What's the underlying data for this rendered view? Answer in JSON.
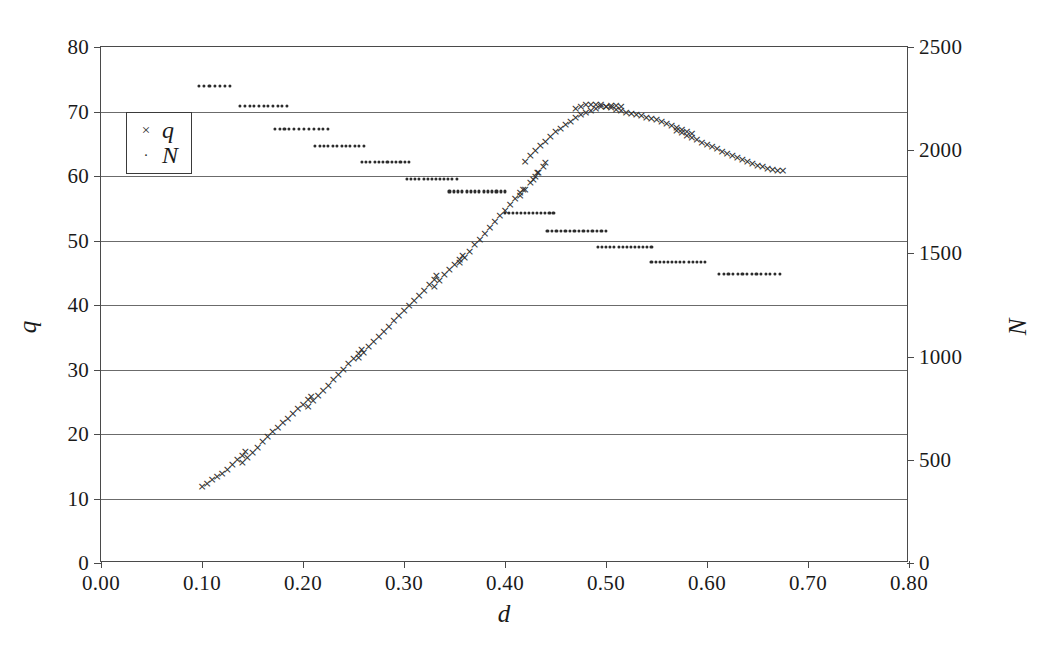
{
  "chart_data": {
    "type": "scatter",
    "title": "",
    "xlabel": "d",
    "ylabel": "q",
    "ylabel_right": "N",
    "xlim": [
      0.0,
      0.8
    ],
    "ylim": [
      0,
      80
    ],
    "ylim_right": [
      0,
      2500
    ],
    "grid": true,
    "legend_position": "upper-left-inside",
    "xticks": [
      "0.00",
      "0.10",
      "0.20",
      "0.30",
      "0.40",
      "0.50",
      "0.60",
      "0.70",
      "0.80"
    ],
    "xtick_values": [
      0.0,
      0.1,
      0.2,
      0.3,
      0.4,
      0.5,
      0.6,
      0.7,
      0.8
    ],
    "yticks": [
      "0",
      "10",
      "20",
      "30",
      "40",
      "50",
      "60",
      "70",
      "80"
    ],
    "ytick_values": [
      0,
      10,
      20,
      30,
      40,
      50,
      60,
      70,
      80
    ],
    "yticks_right": [
      "0",
      "500",
      "1000",
      "1500",
      "2000",
      "2500"
    ],
    "ytick_right_values": [
      0,
      500,
      1000,
      1500,
      2000,
      2500
    ],
    "series": [
      {
        "name": "q",
        "axis": "left",
        "marker": "x",
        "marker_glyph": "×",
        "color": "#2b2b2b",
        "points": [
          [
            0.1,
            12.0
          ],
          [
            0.105,
            12.4
          ],
          [
            0.11,
            13.0
          ],
          [
            0.115,
            13.5
          ],
          [
            0.12,
            14.0
          ],
          [
            0.125,
            14.6
          ],
          [
            0.13,
            15.3
          ],
          [
            0.135,
            16.1
          ],
          [
            0.14,
            16.8
          ],
          [
            0.143,
            17.3
          ],
          [
            0.14,
            15.6
          ],
          [
            0.145,
            16.4
          ],
          [
            0.15,
            17.2
          ],
          [
            0.155,
            18.0
          ],
          [
            0.16,
            18.9
          ],
          [
            0.165,
            19.7
          ],
          [
            0.17,
            20.4
          ],
          [
            0.175,
            21.1
          ],
          [
            0.18,
            21.8
          ],
          [
            0.185,
            22.5
          ],
          [
            0.19,
            23.3
          ],
          [
            0.195,
            24.0
          ],
          [
            0.2,
            24.7
          ],
          [
            0.205,
            25.4
          ],
          [
            0.208,
            25.9
          ],
          [
            0.205,
            24.3
          ],
          [
            0.21,
            25.2
          ],
          [
            0.215,
            26.0
          ],
          [
            0.22,
            26.8
          ],
          [
            0.225,
            27.6
          ],
          [
            0.23,
            28.5
          ],
          [
            0.235,
            29.3
          ],
          [
            0.24,
            30.1
          ],
          [
            0.245,
            31.0
          ],
          [
            0.25,
            31.8
          ],
          [
            0.255,
            32.6
          ],
          [
            0.258,
            33.2
          ],
          [
            0.255,
            31.9
          ],
          [
            0.26,
            32.7
          ],
          [
            0.265,
            33.6
          ],
          [
            0.27,
            34.4
          ],
          [
            0.275,
            35.2
          ],
          [
            0.28,
            36.0
          ],
          [
            0.285,
            36.8
          ],
          [
            0.29,
            37.6
          ],
          [
            0.295,
            38.4
          ],
          [
            0.3,
            39.2
          ],
          [
            0.305,
            40.0
          ],
          [
            0.31,
            40.8
          ],
          [
            0.315,
            41.6
          ],
          [
            0.32,
            42.4
          ],
          [
            0.325,
            43.2
          ],
          [
            0.33,
            44.0
          ],
          [
            0.332,
            44.6
          ],
          [
            0.33,
            43.0
          ],
          [
            0.335,
            43.9
          ],
          [
            0.34,
            44.8
          ],
          [
            0.345,
            45.6
          ],
          [
            0.35,
            46.4
          ],
          [
            0.355,
            47.2
          ],
          [
            0.358,
            47.8
          ],
          [
            0.355,
            46.6
          ],
          [
            0.36,
            47.5
          ],
          [
            0.365,
            48.4
          ],
          [
            0.37,
            49.4
          ],
          [
            0.375,
            50.3
          ],
          [
            0.38,
            51.2
          ],
          [
            0.385,
            52.1
          ],
          [
            0.39,
            53.0
          ],
          [
            0.395,
            53.9
          ],
          [
            0.4,
            54.8
          ],
          [
            0.405,
            55.7
          ],
          [
            0.41,
            56.6
          ],
          [
            0.415,
            57.5
          ],
          [
            0.418,
            58.0
          ],
          [
            0.415,
            57.0
          ],
          [
            0.42,
            58.0
          ],
          [
            0.425,
            59.0
          ],
          [
            0.43,
            60.0
          ],
          [
            0.432,
            60.6
          ],
          [
            0.428,
            59.6
          ],
          [
            0.433,
            60.6
          ],
          [
            0.438,
            61.6
          ],
          [
            0.44,
            62.2
          ],
          [
            0.42,
            62.4
          ],
          [
            0.425,
            63.2
          ],
          [
            0.43,
            64.0
          ],
          [
            0.435,
            64.8
          ],
          [
            0.44,
            65.5
          ],
          [
            0.445,
            66.2
          ],
          [
            0.45,
            66.9
          ],
          [
            0.455,
            67.5
          ],
          [
            0.46,
            68.1
          ],
          [
            0.465,
            68.6
          ],
          [
            0.47,
            69.1
          ],
          [
            0.475,
            69.6
          ],
          [
            0.48,
            70.0
          ],
          [
            0.485,
            70.3
          ],
          [
            0.49,
            70.6
          ],
          [
            0.495,
            70.8
          ],
          [
            0.5,
            70.9
          ],
          [
            0.505,
            71.0
          ],
          [
            0.51,
            71.0
          ],
          [
            0.515,
            70.9
          ],
          [
            0.47,
            70.6
          ],
          [
            0.475,
            70.9
          ],
          [
            0.48,
            71.1
          ],
          [
            0.485,
            71.2
          ],
          [
            0.49,
            71.2
          ],
          [
            0.495,
            71.1
          ],
          [
            0.5,
            70.9
          ],
          [
            0.505,
            70.7
          ],
          [
            0.51,
            70.4
          ],
          [
            0.515,
            70.2
          ],
          [
            0.52,
            70.0
          ],
          [
            0.525,
            69.8
          ],
          [
            0.53,
            69.6
          ],
          [
            0.535,
            69.4
          ],
          [
            0.54,
            69.2
          ],
          [
            0.545,
            69.0
          ],
          [
            0.55,
            68.8
          ],
          [
            0.555,
            68.5
          ],
          [
            0.56,
            68.2
          ],
          [
            0.565,
            67.9
          ],
          [
            0.57,
            67.6
          ],
          [
            0.575,
            67.3
          ],
          [
            0.58,
            67.0
          ],
          [
            0.585,
            66.6
          ],
          [
            0.57,
            67.2
          ],
          [
            0.575,
            66.8
          ],
          [
            0.58,
            66.4
          ],
          [
            0.585,
            66.0
          ],
          [
            0.59,
            65.7
          ],
          [
            0.595,
            65.3
          ],
          [
            0.6,
            65.0
          ],
          [
            0.605,
            64.6
          ],
          [
            0.61,
            64.3
          ],
          [
            0.615,
            63.9
          ],
          [
            0.62,
            63.6
          ],
          [
            0.625,
            63.2
          ],
          [
            0.63,
            62.9
          ],
          [
            0.635,
            62.6
          ],
          [
            0.64,
            62.3
          ],
          [
            0.645,
            62.0
          ],
          [
            0.65,
            61.7
          ],
          [
            0.655,
            61.5
          ],
          [
            0.66,
            61.3
          ],
          [
            0.665,
            61.1
          ],
          [
            0.67,
            61.0
          ],
          [
            0.675,
            61.0
          ]
        ]
      },
      {
        "name": "N",
        "axis": "right",
        "marker": "dot",
        "marker_glyph": "·",
        "color": "#2b2b2b",
        "segments": [
          {
            "x_start": 0.097,
            "x_end": 0.128,
            "value": 2310,
            "count": 7
          },
          {
            "x_start": 0.138,
            "x_end": 0.184,
            "value": 2215,
            "count": 11
          },
          {
            "x_start": 0.172,
            "x_end": 0.225,
            "value": 2105,
            "count": 12
          },
          {
            "x_start": 0.212,
            "x_end": 0.26,
            "value": 2020,
            "count": 12
          },
          {
            "x_start": 0.258,
            "x_end": 0.305,
            "value": 1945,
            "count": 12
          },
          {
            "x_start": 0.303,
            "x_end": 0.352,
            "value": 1860,
            "count": 13
          },
          {
            "x_start": 0.345,
            "x_end": 0.4,
            "value": 1800,
            "count": 14
          },
          {
            "x_start": 0.4,
            "x_end": 0.448,
            "value": 1695,
            "count": 13
          },
          {
            "x_start": 0.442,
            "x_end": 0.5,
            "value": 1610,
            "count": 14
          },
          {
            "x_start": 0.492,
            "x_end": 0.545,
            "value": 1530,
            "count": 14
          },
          {
            "x_start": 0.545,
            "x_end": 0.598,
            "value": 1460,
            "count": 14
          },
          {
            "x_start": 0.612,
            "x_end": 0.672,
            "value": 1400,
            "count": 14
          }
        ]
      }
    ]
  },
  "legend": {
    "entries": [
      {
        "label": "q",
        "marker": "×"
      },
      {
        "label": "N",
        "marker": "·"
      }
    ]
  },
  "caption": ""
}
